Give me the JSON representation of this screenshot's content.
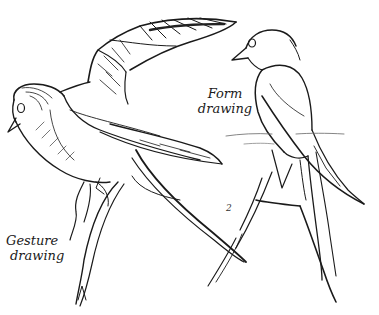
{
  "illustration": {
    "subject": "swallow sketches",
    "ink_color": "#1a1a1a",
    "background": "#ffffff"
  },
  "labels": {
    "form": {
      "line1": "Form",
      "line2": "drawing"
    },
    "gesture": {
      "line1": "Gesture",
      "line2": "drawing"
    },
    "step_mark": "2"
  }
}
